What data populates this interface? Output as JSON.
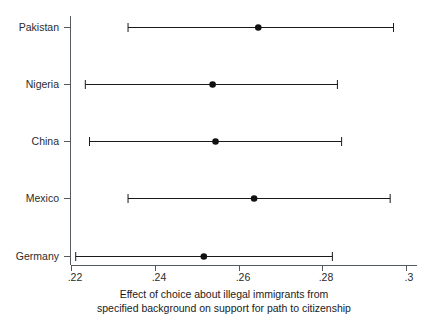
{
  "chart_data": {
    "type": "scatter",
    "title": "",
    "subtitle": "",
    "xlabel_line1": "Effect of choice about illegal immigrants from",
    "xlabel_line2": "specified background on support for path to citizenship",
    "ylabel": "",
    "orientation": "horizontal",
    "grid": false,
    "legend": "none",
    "xlim": [
      0.2185,
      0.3015
    ],
    "xticks": [
      0.22,
      0.24,
      0.26,
      0.28,
      0.3
    ],
    "xtick_labels": [
      ".22",
      ".24",
      ".26",
      ".28",
      ".3"
    ],
    "categories": [
      "Pakistan",
      "Nigeria",
      "China",
      "Mexico",
      "Germany"
    ],
    "values": [
      0.2646,
      0.2537,
      0.2544,
      0.2636,
      0.2516
    ],
    "ci_low": [
      0.2335,
      0.2233,
      0.2243,
      0.2335,
      0.221
    ],
    "ci_high": [
      0.2969,
      0.2835,
      0.2845,
      0.2961,
      0.2823
    ],
    "points": [
      {
        "category": "Pakistan",
        "estimate": 0.2646,
        "ci_low": 0.2335,
        "ci_high": 0.2969
      },
      {
        "category": "Nigeria",
        "estimate": 0.2537,
        "ci_low": 0.2233,
        "ci_high": 0.2835
      },
      {
        "category": "China",
        "estimate": 0.2544,
        "ci_low": 0.2243,
        "ci_high": 0.2845
      },
      {
        "category": "Mexico",
        "estimate": 0.2636,
        "ci_low": 0.2335,
        "ci_high": 0.2961
      },
      {
        "category": "Germany",
        "estimate": 0.2516,
        "ci_low": 0.221,
        "ci_high": 0.2823
      }
    ],
    "colors": {
      "marker": "#111111",
      "interval": "#1a1a1a",
      "axis": "#555a5e",
      "text": "#1a1a1a",
      "background": "#ffffff"
    }
  },
  "axis": {
    "y_tick_labels": [
      "Pakistan",
      "Nigeria",
      "China",
      "Mexico",
      "Germany"
    ],
    "x_tick_labels": [
      ".22",
      ".24",
      ".26",
      ".28",
      ".3"
    ]
  },
  "caption": {
    "line1": "Effect of choice about illegal immigrants from",
    "line2": "specified background on support for path to citizenship"
  }
}
